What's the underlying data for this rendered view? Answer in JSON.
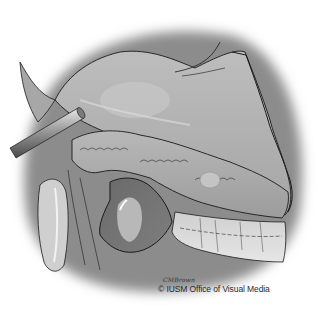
{
  "image": {
    "subject": "Surgical illustration: retracted stomach/liver exposing pancreas and lesser sac",
    "style": "grayscale medical illustration"
  },
  "credits": {
    "artist_signature": "CMBrown",
    "copyright": "© IUSM Office of Visual Media"
  },
  "colors": {
    "background": "#ffffff",
    "tissue_light": "#c8c8c8",
    "tissue_mid": "#9a9a9a",
    "tissue_dark": "#5a5a5a",
    "outline": "#1a1a1a",
    "retractor": "#b0b0b0"
  }
}
